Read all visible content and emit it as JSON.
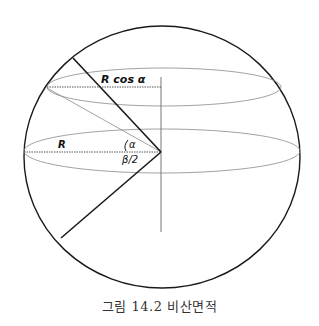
{
  "figure": {
    "caption": "그림 14.2 비산면적",
    "labels": {
      "radius": "R",
      "r_cos_alpha": "R cos α",
      "alpha": "α",
      "beta_half": "β/2"
    },
    "colors": {
      "outline": "#1a1a1a",
      "thin_line": "#8a8a8a",
      "dotted_line": "#555555"
    }
  }
}
